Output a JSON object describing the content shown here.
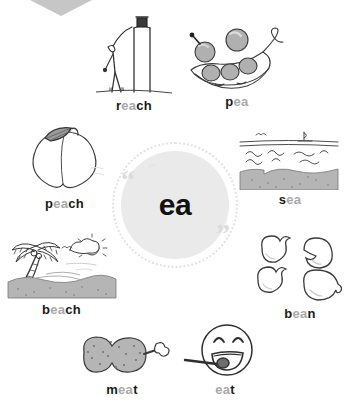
{
  "poster": {
    "title": "ea word web",
    "center": {
      "sound": "ea",
      "quote_open": "“",
      "quote_close": "”",
      "tick": "⌐"
    },
    "colors": {
      "accent_gray": "#a8a8a8",
      "disc_gray": "#eaeaea",
      "ring_gray": "#e2e2e2",
      "ink": "#1a1a1a",
      "chevron_gray": "#c6c6c6",
      "fill_gray": "#b5b5b5"
    }
  },
  "words": [
    {
      "id": "reach",
      "prefix": "r",
      "sound": "ea",
      "suffix": "ch",
      "icon": "stick-figure-reaching-icon"
    },
    {
      "id": "pea",
      "prefix": "p",
      "sound": "ea",
      "suffix": "",
      "icon": "pea-pod-icon"
    },
    {
      "id": "peach",
      "prefix": "p",
      "sound": "ea",
      "suffix": "ch",
      "icon": "peach-fruit-icon"
    },
    {
      "id": "sea",
      "prefix": "s",
      "sound": "ea",
      "suffix": "",
      "icon": "sea-waves-icon"
    },
    {
      "id": "beach",
      "prefix": "b",
      "sound": "ea",
      "suffix": "ch",
      "icon": "beach-palm-tree-icon"
    },
    {
      "id": "bean",
      "prefix": "b",
      "sound": "ea",
      "suffix": "n",
      "icon": "beans-icon"
    },
    {
      "id": "meat",
      "prefix": "m",
      "sound": "ea",
      "suffix": "t",
      "icon": "meat-ham-icon"
    },
    {
      "id": "eat",
      "prefix": "",
      "sound": "ea",
      "suffix": "t",
      "icon": "smiley-eating-icon"
    }
  ]
}
